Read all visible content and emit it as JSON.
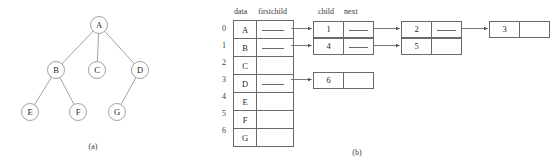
{
  "figure": {
    "panel_a": {
      "caption": "(a)",
      "nodes": [
        {
          "id": "A",
          "label": "A",
          "cx": 99,
          "cy": 25
        },
        {
          "id": "B",
          "label": "B",
          "cx": 56,
          "cy": 70
        },
        {
          "id": "C",
          "label": "C",
          "cx": 97,
          "cy": 70
        },
        {
          "id": "D",
          "label": "D",
          "cx": 140,
          "cy": 70
        },
        {
          "id": "E",
          "label": "E",
          "cx": 30,
          "cy": 112
        },
        {
          "id": "F",
          "label": "F",
          "cx": 78,
          "cy": 112
        },
        {
          "id": "G",
          "label": "G",
          "cx": 117,
          "cy": 112
        }
      ],
      "edges": [
        {
          "from": "A",
          "to": "B"
        },
        {
          "from": "A",
          "to": "C"
        },
        {
          "from": "A",
          "to": "D"
        },
        {
          "from": "B",
          "to": "E"
        },
        {
          "from": "B",
          "to": "F"
        },
        {
          "from": "D",
          "to": "G"
        }
      ],
      "node_radius": 8.5
    },
    "panel_b": {
      "caption": "(b)",
      "headers": {
        "data": "data",
        "firstchild": "firstchild",
        "child": "child",
        "next": "next"
      },
      "table_rows": [
        {
          "index": "0",
          "data": "A",
          "has_firstchild": true
        },
        {
          "index": "1",
          "data": "B",
          "has_firstchild": true
        },
        {
          "index": "2",
          "data": "C",
          "has_firstchild": false
        },
        {
          "index": "3",
          "data": "D",
          "has_firstchild": true
        },
        {
          "index": "4",
          "data": "E",
          "has_firstchild": false
        },
        {
          "index": "5",
          "data": "F",
          "has_firstchild": false
        },
        {
          "index": "6",
          "data": "G",
          "has_firstchild": false
        }
      ],
      "child_lists": [
        {
          "row": "0",
          "nodes": [
            {
              "child": "1",
              "has_next": true
            },
            {
              "child": "2",
              "has_next": true
            },
            {
              "child": "3",
              "has_next": false
            }
          ]
        },
        {
          "row": "1",
          "nodes": [
            {
              "child": "4",
              "has_next": true
            },
            {
              "child": "5",
              "has_next": false
            }
          ]
        },
        {
          "row": "3",
          "nodes": [
            {
              "child": "6",
              "has_next": false
            }
          ]
        }
      ]
    }
  },
  "colors": {
    "stroke": "#6a6a6a",
    "text": "#1f1f1f",
    "background": "#ffffff"
  }
}
